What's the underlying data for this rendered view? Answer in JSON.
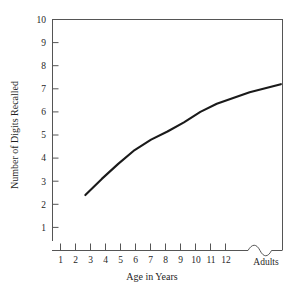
{
  "chart_data": {
    "type": "line",
    "title": "",
    "xlabel": "Age in Years",
    "ylabel": "Number of Digits Recalled",
    "xlim": [
      0,
      14
    ],
    "ylim": [
      0,
      10
    ],
    "grid": false,
    "legend": null,
    "x_tick_labels": [
      "1",
      "2",
      "3",
      "4",
      "5",
      "6",
      "7",
      "8",
      "9",
      "10",
      "11",
      "12"
    ],
    "x_category_labels": [
      "Adults"
    ],
    "axis_break": "squiggle",
    "y_tick_labels": [
      "1",
      "2",
      "3",
      "4",
      "5",
      "6",
      "7",
      "8",
      "9",
      "10"
    ],
    "series": [
      {
        "name": "Digit span",
        "x": [
          2,
          3,
          4,
          5,
          6,
          7,
          8,
          9,
          10,
          11,
          12,
          13.9
        ],
        "values": [
          2.4,
          3.1,
          3.75,
          4.35,
          4.8,
          5.15,
          5.55,
          6.0,
          6.35,
          6.6,
          6.85,
          7.2
        ]
      }
    ]
  },
  "style": {
    "line_color": "#1a1a1a",
    "axis_color": "#555555",
    "background": "#ffffff",
    "text_color": "#1f1f1f"
  }
}
